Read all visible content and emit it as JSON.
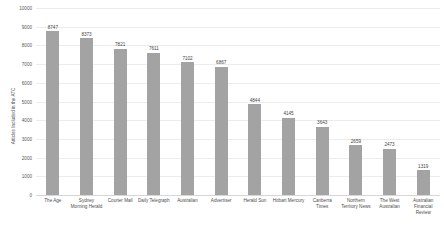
{
  "chart_data": {
    "type": "bar",
    "title": "",
    "xlabel": "",
    "ylabel": "Articles Included in the ATC",
    "ylim": [
      0,
      10000
    ],
    "ytick_labels": [
      "10000",
      "9000",
      "8000",
      "7000",
      "6000",
      "5000",
      "4000",
      "3000",
      "2000",
      "1000",
      "0"
    ],
    "ytick_values": [
      10000,
      9000,
      8000,
      7000,
      6000,
      5000,
      4000,
      3000,
      2000,
      1000,
      0
    ],
    "grid": true,
    "legend": "none",
    "bar_color": "#a3a3a3",
    "gridline_color": "#ececec",
    "categories": [
      "The Age",
      "Sydney Morning Herald",
      "Courier Mail",
      "Daily Telegraph",
      "Australian",
      "Advertiser",
      "Herald Sun",
      "Hobart Mercury",
      "Canberra Times",
      "Northern Territory News",
      "The West Australian",
      "Australian Financial Review"
    ],
    "values": [
      8747,
      8373,
      7821,
      7611,
      7102,
      6867,
      4844,
      4145,
      3643,
      2659,
      2473,
      1319
    ],
    "value_labels": [
      "8747",
      "8373",
      "7821",
      "7611",
      "7102",
      "6867",
      "4844",
      "4145",
      "3643",
      "2659",
      "2473",
      "1319"
    ]
  }
}
